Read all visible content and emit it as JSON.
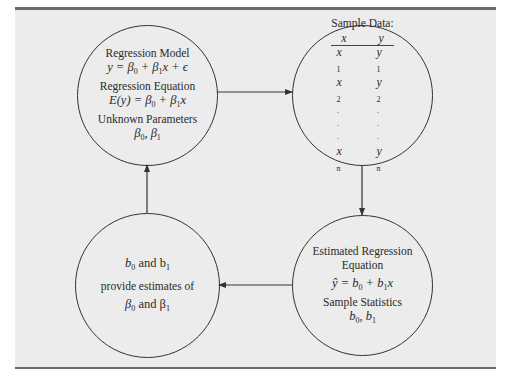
{
  "diagram": {
    "type": "cycle-flow",
    "colors": {
      "background": "#ececec",
      "border_bars": "#6b6b6b",
      "stroke": "#333333"
    },
    "nodes": {
      "population": {
        "title1": "Regression Model",
        "eq1_lhs": "y = β",
        "eq1_s0": "0",
        "eq1_mid": " + β",
        "eq1_s1": "1",
        "eq1_rhs": "x + ϵ",
        "title2": "Regression Equation",
        "eq2_lhs": "E(y)  = β",
        "eq2_s0": "0",
        "eq2_mid": " + β",
        "eq2_s1": "1",
        "eq2_rhs": "x",
        "title3": "Unknown Parameters",
        "params_a": "β",
        "params_s0": "0",
        "params_sep": ", β",
        "params_s1": "1"
      },
      "sample": {
        "title": "Sample Data:",
        "col_x": "x",
        "col_y": "y",
        "rows": [
          {
            "x": "x",
            "xs": "1",
            "y": "y",
            "ys": "1"
          },
          {
            "x": "x",
            "xs": "2",
            "y": "y",
            "ys": "2"
          },
          {
            "x": "·",
            "xs": "",
            "y": "·",
            "ys": ""
          },
          {
            "x": "·",
            "xs": "",
            "y": "·",
            "ys": ""
          },
          {
            "x": "·",
            "xs": "",
            "y": "·",
            "ys": ""
          },
          {
            "x": "x",
            "xs": "n",
            "y": "y",
            "ys": "n"
          }
        ]
      },
      "estimated": {
        "title1": "Estimated Regression",
        "title2": "Equation",
        "eq_lhs": "ŷ = b",
        "eq_s0": "0",
        "eq_mid": " + b",
        "eq_s1": "1",
        "eq_rhs": "x",
        "title3": "Sample Statistics",
        "stat_a": "b",
        "stat_s0": "0",
        "stat_sep": ", b",
        "stat_s1": "1"
      },
      "inference": {
        "l1_a": "b",
        "l1_s0": "0",
        "l1_mid": " and b",
        "l1_s1": "1",
        "l2": "provide estimates of",
        "l3_a": "β",
        "l3_s0": "0",
        "l3_mid": " and β",
        "l3_s1": "1"
      }
    },
    "edges": [
      {
        "from": "population",
        "to": "sample",
        "direction": "right"
      },
      {
        "from": "sample",
        "to": "estimated",
        "direction": "down"
      },
      {
        "from": "estimated",
        "to": "inference",
        "direction": "left"
      },
      {
        "from": "inference",
        "to": "population",
        "direction": "up"
      }
    ]
  }
}
